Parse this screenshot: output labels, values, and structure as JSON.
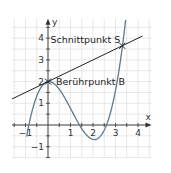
{
  "chart_data": {
    "type": "line",
    "title": "",
    "xlabel": "x",
    "ylabel": "y",
    "xlim": [
      -1.6,
      4.6
    ],
    "ylim": [
      -1.5,
      4.9
    ],
    "grid": true,
    "grid_step": 0.5,
    "x_ticks": [
      -1,
      1,
      2,
      3,
      4
    ],
    "x_tick_labels": [
      "−1",
      "1",
      "2",
      "3",
      "4"
    ],
    "y_ticks": [
      -1,
      1,
      2,
      3,
      4
    ],
    "y_tick_labels": [
      "−1",
      "1",
      "2",
      "3",
      "4"
    ],
    "series": [
      {
        "name": "cubic curve",
        "kind": "function",
        "roots": [
          -0.85,
          1.4,
          2.6
        ],
        "leading_coefficient": 0.646,
        "x_range": [
          -0.95,
          3.45
        ],
        "color": "#5b7a8f"
      },
      {
        "name": "tangent line",
        "kind": "line",
        "slope": 0.5,
        "intercept": 2,
        "x_range": [
          -1.6,
          4.2
        ],
        "color": "#222222"
      }
    ],
    "annotations": [
      {
        "label": "Berührpunkt B",
        "x": 0,
        "y": 2
      },
      {
        "label": "Schnittpunkt S",
        "x": 3.3,
        "y": 3.65
      }
    ]
  }
}
